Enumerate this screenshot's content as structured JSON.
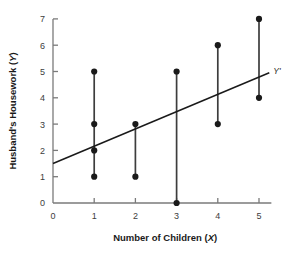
{
  "chart_data": {
    "type": "scatter",
    "title": "",
    "xlabel": "Number of Children (X)",
    "ylabel": "Husband's Housework (Y)",
    "xlabel_main": "Number of Children",
    "xlabel_var": "X",
    "ylabel_main": "Husband's Housework",
    "ylabel_var": "Y",
    "xlim": [
      0,
      5.3
    ],
    "ylim": [
      0,
      7
    ],
    "xticks": [
      0,
      1,
      2,
      3,
      4,
      5
    ],
    "yticks": [
      0,
      1,
      2,
      3,
      4,
      5,
      6,
      7
    ],
    "xtick_labels": [
      "0",
      "1",
      "2",
      "3",
      "4",
      "5"
    ],
    "ytick_labels": [
      "0",
      "1",
      "2",
      "3",
      "4",
      "5",
      "6",
      "7"
    ],
    "grid": false,
    "legend": "none",
    "points": [
      {
        "x": 1,
        "y": 5
      },
      {
        "x": 1,
        "y": 3
      },
      {
        "x": 1,
        "y": 2
      },
      {
        "x": 1,
        "y": 1
      },
      {
        "x": 2,
        "y": 3
      },
      {
        "x": 2,
        "y": 1
      },
      {
        "x": 3,
        "y": 5
      },
      {
        "x": 3,
        "y": 0
      },
      {
        "x": 4,
        "y": 6
      },
      {
        "x": 4,
        "y": 3
      },
      {
        "x": 5,
        "y": 7
      },
      {
        "x": 5,
        "y": 4
      }
    ],
    "connectors": [
      {
        "x": 1,
        "y_top": 5,
        "y_bottom": 1
      },
      {
        "x": 2,
        "y_top": 3,
        "y_bottom": 1
      },
      {
        "x": 3,
        "y_top": 5,
        "y_bottom": 0
      },
      {
        "x": 4,
        "y_top": 6,
        "y_bottom": 3
      },
      {
        "x": 5,
        "y_top": 7,
        "y_bottom": 4
      }
    ],
    "regression_line": {
      "label": "Y'",
      "x_start": 0,
      "y_start": 1.5,
      "x_end": 5.25,
      "y_end": 4.95,
      "intercept": 1.5,
      "slope": 0.657
    },
    "colors": {
      "axis": "#7a7a7a",
      "point": "#1a1a1a",
      "connector": "#3d3d3d",
      "regression": "#1a1a1a",
      "background": "#ffffff",
      "text": "#1a1a1a",
      "tick_text": "#3d3d3d"
    }
  }
}
